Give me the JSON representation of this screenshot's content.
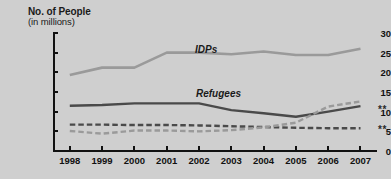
{
  "chart_data": {
    "type": "line",
    "title": "No. of People",
    "subtitle": "(in millions)",
    "xlabel": "",
    "ylabel": "No. of People (in millions)",
    "x": [
      1998,
      1999,
      2000,
      2001,
      2002,
      2003,
      2004,
      2005,
      2006,
      2007
    ],
    "categories": [
      "1998",
      "1999",
      "2000",
      "2001",
      "2002",
      "2003",
      "2004",
      "2005",
      "2006",
      "2007"
    ],
    "ylim": [
      0,
      30
    ],
    "yticks": [
      0,
      5,
      10,
      15,
      20,
      25,
      30
    ],
    "ytick_labels": [
      "0",
      "5",
      "10",
      "15",
      "20",
      "25",
      "30"
    ],
    "grid": false,
    "legend_position": "inline-annotations",
    "series": [
      {
        "name": "IDPs",
        "style": "solid",
        "color": "#9a9a9a",
        "width": 2.6,
        "values": [
          19.3,
          21.2,
          21.2,
          25.0,
          25.0,
          24.6,
          25.3,
          24.4,
          24.4,
          26.0
        ]
      },
      {
        "name": "Refugees",
        "style": "solid",
        "color": "#4a4a4a",
        "width": 2.4,
        "values": [
          11.5,
          11.7,
          12.1,
          12.1,
          12.1,
          10.4,
          9.6,
          8.7,
          10.0,
          11.4
        ],
        "footnote_marker": "**"
      },
      {
        "name": "dark-dashed-series",
        "style": "dashed",
        "color": "#4a4a4a",
        "width": 2.4,
        "values": [
          6.7,
          6.7,
          6.6,
          6.6,
          6.5,
          6.3,
          6.1,
          5.9,
          5.8,
          5.8
        ],
        "footnote_marker": "**"
      },
      {
        "name": "light-dashed-series",
        "style": "dashed",
        "color": "#9a9a9a",
        "width": 2.4,
        "values": [
          5.1,
          4.4,
          5.2,
          5.2,
          5.0,
          5.3,
          6.0,
          7.2,
          11.3,
          12.6
        ]
      }
    ],
    "annotations": [
      {
        "text": "IDPs",
        "x": 2004,
        "y": 27.2
      },
      {
        "text": "Refugees",
        "x": 2004,
        "y": 13.3
      },
      {
        "text": "**",
        "x": 2007.6,
        "y": 11.4
      },
      {
        "text": "**",
        "x": 2007.6,
        "y": 5.8
      }
    ]
  }
}
